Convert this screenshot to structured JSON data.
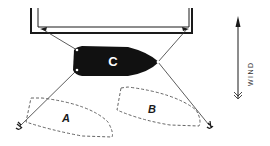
{
  "diagram": {
    "type": "mooring-diagram",
    "colors": {
      "ink": "#1a1a1a",
      "boat_fill": "#111111",
      "dashed": "#555555",
      "background": "#ffffff"
    },
    "dock": {
      "name": "pontoon"
    },
    "boats": [
      {
        "id": "C",
        "label": "C",
        "style": "solid-black"
      },
      {
        "id": "A",
        "label": "A",
        "style": "dashed-outline"
      },
      {
        "id": "B",
        "label": "B",
        "style": "dashed-outline"
      }
    ],
    "wind": {
      "label": "WIND",
      "direction": "up"
    }
  }
}
